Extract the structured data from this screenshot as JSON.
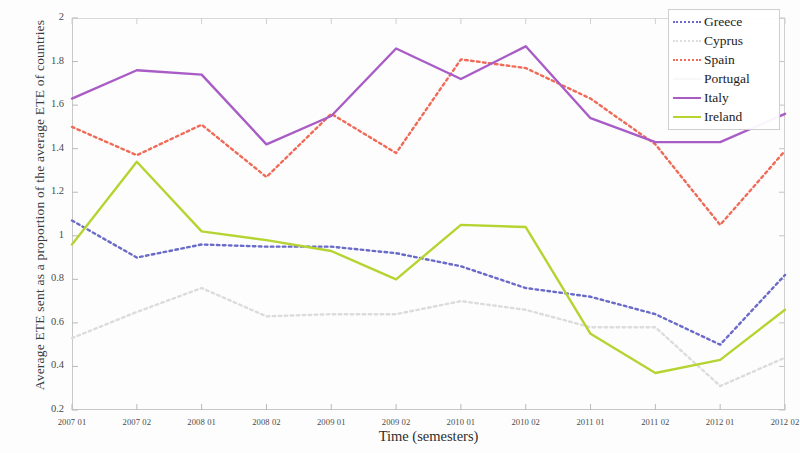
{
  "chart_data": {
    "type": "line",
    "title": "",
    "xlabel": "Time (semesters)",
    "ylabel": "Average ETE sent as a proportion of the average ETE of countries",
    "categories": [
      "2007 01",
      "2007 02",
      "2008 01",
      "2008 02",
      "2009 01",
      "2009 02",
      "2010 01",
      "2010 02",
      "2011 01",
      "2011 02",
      "2012 01",
      "2012 02"
    ],
    "xlim": [
      0,
      11
    ],
    "ylim": [
      0.2,
      2.0
    ],
    "yticks": [
      "0.2",
      "0.4",
      "0.6",
      "0.8",
      "1",
      "1.2",
      "1.4",
      "1.6",
      "1.8",
      "2"
    ],
    "grid": false,
    "legend_position": "top-right",
    "series": [
      {
        "name": "Greece",
        "color": "#6a6ac8",
        "style": "dotted",
        "values": [
          1.07,
          0.9,
          0.96,
          0.95,
          0.95,
          0.92,
          0.86,
          0.76,
          0.72,
          0.64,
          0.5,
          0.82
        ]
      },
      {
        "name": "Cyprus",
        "color": "#dcdcdc",
        "style": "dotted",
        "values": [
          0.53,
          0.65,
          0.76,
          0.63,
          0.64,
          0.64,
          0.7,
          0.66,
          0.58,
          0.58,
          0.31,
          0.44
        ]
      },
      {
        "name": "Spain",
        "color": "#f06a58",
        "style": "dotted",
        "values": [
          1.5,
          1.37,
          1.51,
          1.27,
          1.56,
          1.38,
          1.81,
          1.77,
          1.63,
          1.42,
          1.05,
          1.39
        ]
      },
      {
        "name": "Portugal",
        "color": "#f8f8f8",
        "style": "solid",
        "values": [
          null,
          null,
          null,
          null,
          null,
          null,
          null,
          null,
          null,
          null,
          null,
          null
        ]
      },
      {
        "name": "Italy",
        "color": "#a95cc6",
        "style": "solid",
        "values": [
          1.63,
          1.76,
          1.74,
          1.42,
          1.55,
          1.86,
          1.72,
          1.87,
          1.54,
          1.43,
          1.43,
          1.56
        ]
      },
      {
        "name": "Ireland",
        "color": "#b5d432",
        "style": "solid",
        "values": [
          0.96,
          1.34,
          1.02,
          0.98,
          0.93,
          0.8,
          1.05,
          1.04,
          0.55,
          0.37,
          0.43,
          0.66
        ]
      }
    ]
  },
  "legend": {
    "items": [
      {
        "label": "Greece"
      },
      {
        "label": "Cyprus"
      },
      {
        "label": "Spain"
      },
      {
        "label": "Portugal"
      },
      {
        "label": "Italy"
      },
      {
        "label": "Ireland"
      }
    ]
  }
}
